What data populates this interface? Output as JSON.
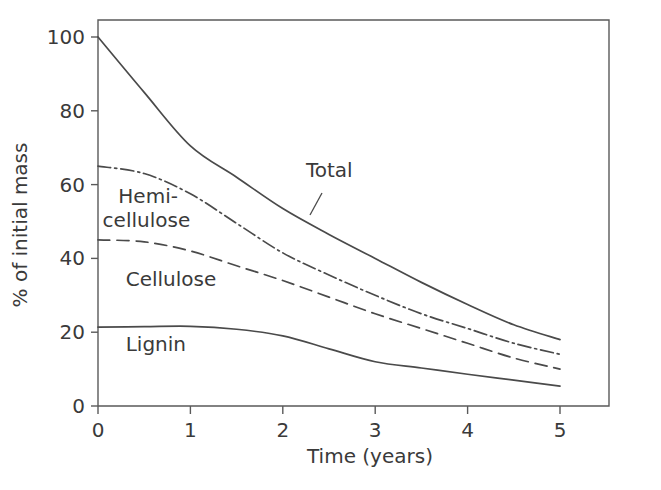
{
  "chart_data": {
    "type": "line",
    "title": "",
    "xlabel": "Time (years)",
    "ylabel": "% of initial mass",
    "xlim": [
      0,
      5.55
    ],
    "ylim": [
      0,
      105
    ],
    "xticks": [
      "0",
      "1",
      "2",
      "3",
      "4",
      "5"
    ],
    "xtick_values": [
      0,
      1,
      2,
      3,
      4,
      5
    ],
    "yticks": [
      "0",
      "20",
      "40",
      "60",
      "80",
      "100"
    ],
    "ytick_values": [
      0,
      20,
      40,
      60,
      80,
      100
    ],
    "grid": false,
    "legend": "inline-labels",
    "x": [
      0,
      0.5,
      1,
      1.5,
      2,
      2.5,
      3,
      3.5,
      4,
      4.5,
      5
    ],
    "series": [
      {
        "name": "Total",
        "style": "solid",
        "label_text": "Total",
        "values": [
          100,
          85,
          70.5,
          62,
          53.5,
          46.5,
          40,
          33.5,
          27.5,
          22,
          18
        ]
      },
      {
        "name": "Hemi-cellulose",
        "style": "dash-dot",
        "label_text": "Hemi-\ncellulose",
        "values": [
          65,
          63,
          57.5,
          49.5,
          41.5,
          35.5,
          30,
          25,
          21,
          17,
          14
        ]
      },
      {
        "name": "Cellulose",
        "style": "dashed",
        "label_text": "Cellulose",
        "values": [
          45,
          44.5,
          42,
          38,
          34,
          29.5,
          25,
          21,
          17,
          13,
          10
        ]
      },
      {
        "name": "Lignin",
        "style": "solid",
        "label_text": "Lignin",
        "values": [
          21.4,
          21.5,
          21.6,
          20.8,
          19,
          15.5,
          12,
          10.3,
          8.6,
          7,
          5.4
        ]
      }
    ],
    "annotations": [
      {
        "text": "Total",
        "x": 2.25,
        "y": 62
      },
      {
        "text": "Hemi-",
        "x": 0.22,
        "y": 55
      },
      {
        "text": "cellulose",
        "x": 0.05,
        "y": 48.5
      },
      {
        "text": "Cellulose",
        "x": 0.3,
        "y": 32.5
      },
      {
        "text": "Lignin",
        "x": 0.3,
        "y": 15
      }
    ],
    "colors": {
      "line": "#4a4a4a",
      "axis": "#5a5a5a",
      "text": "#3a3a3a",
      "background": "#ffffff"
    }
  }
}
